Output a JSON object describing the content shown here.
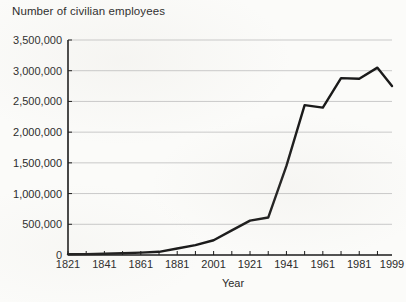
{
  "chart_data": {
    "type": "line",
    "title": "Number of civilian employees",
    "xlabel": "Year",
    "ylabel": "",
    "xlim": [
      1821,
      1999
    ],
    "ylim": [
      0,
      3500000
    ],
    "grid": true,
    "legend": "none",
    "y_ticks": [
      "0",
      "500,000",
      "1,000,000",
      "1,500,000",
      "2,000,000",
      "2,500,000",
      "3,000,000",
      "3,500,000"
    ],
    "y_tick_values": [
      0,
      500000,
      1000000,
      1500000,
      2000000,
      2500000,
      3000000,
      3500000
    ],
    "x_ticks": [
      "1821",
      "1841",
      "1861",
      "1881",
      "2001",
      "1921",
      "1941",
      "1961",
      "1981",
      "1999"
    ],
    "x_tick_values": [
      1821,
      1841,
      1861,
      1881,
      1901,
      1921,
      1941,
      1961,
      1981,
      1999
    ],
    "x_minor_step": 10,
    "series": [
      {
        "name": "Number of civilian employees",
        "color": "#1a1a1a",
        "x": [
          1821,
          1831,
          1841,
          1851,
          1861,
          1871,
          1881,
          1891,
          1901,
          1911,
          1921,
          1931,
          1941,
          1951,
          1961,
          1971,
          1981,
          1991,
          1999
        ],
        "values": [
          12000,
          15000,
          20000,
          28000,
          38000,
          52000,
          105000,
          160000,
          240000,
          400000,
          560000,
          610000,
          1450000,
          2440000,
          2400000,
          2880000,
          2870000,
          3050000,
          2750000
        ]
      }
    ]
  },
  "colors": {
    "line": "#1a1a1a",
    "axis": "#1a1a1a",
    "grid": "#c9c9c9",
    "text": "#2b2b2b",
    "background": "#fbfbf9"
  }
}
